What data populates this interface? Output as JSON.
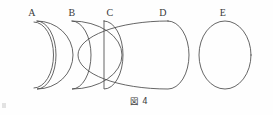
{
  "figure": {
    "caption": "図 4",
    "caption_number": "4",
    "background_color": "#fefefe",
    "stroke_color": "#4a4a4a",
    "label_color": "#3a3a3a",
    "width": 273,
    "height": 115
  },
  "phases": [
    {
      "label": "A",
      "name": "waxing-crescent-thin",
      "label_x": 32,
      "label_y": 16,
      "center_x": 42,
      "center_y": 55,
      "radius_x": 19,
      "radius_y": 34,
      "illumination_percent": 5,
      "terminator_curvature": -0.86,
      "description": "very thin crescent, lit limb on right"
    },
    {
      "label": "B",
      "name": "waxing-crescent",
      "label_x": 72,
      "label_y": 16,
      "center_x": 80,
      "center_y": 55,
      "radius_x": 19,
      "radius_y": 34,
      "illumination_percent": 25,
      "terminator_curvature": -0.55,
      "description": "crescent, lit limb on right"
    },
    {
      "label": "C",
      "name": "first-quarter",
      "label_x": 110,
      "label_y": 16,
      "center_x": 116,
      "center_y": 55,
      "radius_x": 19,
      "radius_y": 34,
      "illumination_percent": 50,
      "terminator_curvature": 0,
      "description": "half moon, straight terminator"
    },
    {
      "label": "D",
      "name": "waxing-gibbous",
      "label_x": 163,
      "label_y": 16,
      "center_x": 168,
      "center_y": 55,
      "radius_x": 21,
      "radius_y": 34,
      "illumination_percent": 80,
      "terminator_curvature": 0.62,
      "description": "gibbous, slight concave left limb"
    },
    {
      "label": "E",
      "name": "full-moon",
      "label_x": 223,
      "label_y": 16,
      "center_x": 225,
      "center_y": 55,
      "radius_x": 26,
      "radius_y": 34,
      "illumination_percent": 100,
      "terminator_curvature": 1,
      "description": "full circle"
    }
  ]
}
